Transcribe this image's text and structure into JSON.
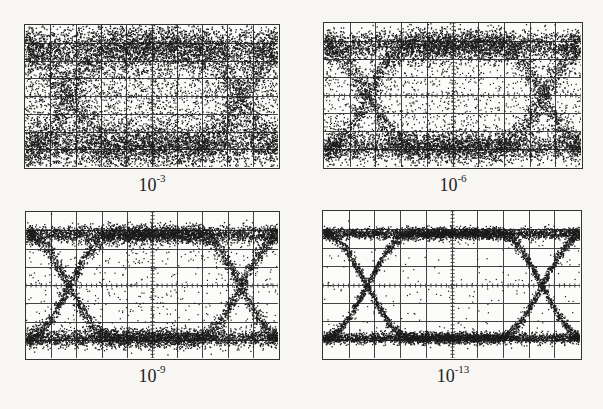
{
  "chart_data": {
    "type": "scatter",
    "panels": [
      {
        "id": "tl",
        "label_base": "10",
        "label_exp": "-3",
        "ber": 0.001,
        "eye_opening": "nearly closed",
        "noise_level": 0.42
      },
      {
        "id": "tr",
        "label_base": "10",
        "label_exp": "-6",
        "ber": 1e-06,
        "eye_opening": "small",
        "noise_level": 0.28
      },
      {
        "id": "bl",
        "label_base": "10",
        "label_exp": "-9",
        "ber": 1e-09,
        "eye_opening": "moderate",
        "noise_level": 0.16
      },
      {
        "id": "br",
        "label_base": "10",
        "label_exp": "-13",
        "ber": 1e-13,
        "eye_opening": "wide open",
        "noise_level": 0.1
      }
    ],
    "grid": {
      "x_divisions": 10,
      "y_divisions": 8
    },
    "title": "",
    "xlabel": "",
    "ylabel": ""
  },
  "labels": {
    "tl": {
      "base": "10",
      "exp": "-3"
    },
    "tr": {
      "base": "10",
      "exp": "-6"
    },
    "bl": {
      "base": "10",
      "exp": "-9"
    },
    "br": {
      "base": "10",
      "exp": "-13"
    }
  }
}
